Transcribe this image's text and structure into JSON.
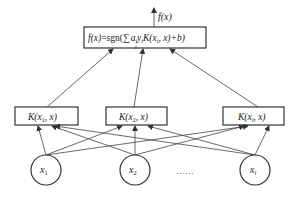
{
  "diagram": {
    "output": {
      "label": "f(x)",
      "formula": {
        "lhs": "f(x)",
        "eq": "=sgn(",
        "sum": "∑",
        "sum_index": "i",
        "coef": "a",
        "coef_sub": "i",
        "label_y": "y",
        "label_y_sub": "i",
        "kernel": "K(x",
        "kernel_sub": "i",
        "kernel_rest": ",  x)+b)"
      }
    },
    "kernels": [
      {
        "pre": "K(x",
        "sub": "1",
        "post": ",  x)"
      },
      {
        "pre": "K(x",
        "sub": "2",
        "post": ",  x)"
      },
      {
        "pre": "K(x",
        "sub": "l",
        "post": ",  x)"
      }
    ],
    "inputs": [
      {
        "name": "x",
        "sub": "1"
      },
      {
        "name": "x",
        "sub": "2"
      },
      {
        "name": "x",
        "sub": "l"
      }
    ],
    "ellipsis": "……"
  }
}
